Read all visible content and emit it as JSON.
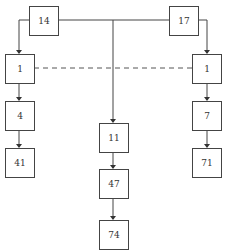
{
  "diagram": {
    "nodes": [
      {
        "id": "n14",
        "label": "14",
        "x": 29,
        "y": 6,
        "w": 29,
        "h": 29
      },
      {
        "id": "n17",
        "label": "17",
        "x": 169,
        "y": 6,
        "w": 29,
        "h": 29
      },
      {
        "id": "n1L",
        "label": "1",
        "x": 5,
        "y": 54,
        "w": 29,
        "h": 29
      },
      {
        "id": "n1R",
        "label": "1",
        "x": 192,
        "y": 54,
        "w": 29,
        "h": 29
      },
      {
        "id": "n4",
        "label": "4",
        "x": 5,
        "y": 101,
        "w": 29,
        "h": 29
      },
      {
        "id": "n41",
        "label": "41",
        "x": 5,
        "y": 148,
        "w": 29,
        "h": 29
      },
      {
        "id": "n7",
        "label": "7",
        "x": 192,
        "y": 101,
        "w": 29,
        "h": 29
      },
      {
        "id": "n71",
        "label": "71",
        "x": 192,
        "y": 148,
        "w": 29,
        "h": 29
      },
      {
        "id": "n11",
        "label": "11",
        "x": 99,
        "y": 123,
        "w": 29,
        "h": 29
      },
      {
        "id": "n47",
        "label": "47",
        "x": 99,
        "y": 169,
        "w": 29,
        "h": 29
      },
      {
        "id": "n74",
        "label": "74",
        "x": 99,
        "y": 220,
        "w": 29,
        "h": 29
      }
    ],
    "edges": [
      {
        "from": "n14",
        "to": "n1L",
        "style": "solid",
        "arrow": true
      },
      {
        "from": "n17",
        "to": "n1R",
        "style": "solid",
        "arrow": true
      },
      {
        "from": "n14",
        "to": "n17",
        "style": "solid",
        "arrow": false
      },
      {
        "from": "n14-n17-line",
        "to": "n11",
        "style": "solid",
        "arrow": true
      },
      {
        "from": "n1L",
        "to": "n4",
        "style": "solid",
        "arrow": true
      },
      {
        "from": "n4",
        "to": "n41",
        "style": "solid",
        "arrow": true
      },
      {
        "from": "n1R",
        "to": "n7",
        "style": "solid",
        "arrow": true
      },
      {
        "from": "n7",
        "to": "n71",
        "style": "solid",
        "arrow": true
      },
      {
        "from": "n11",
        "to": "n47",
        "style": "solid",
        "arrow": true
      },
      {
        "from": "n47",
        "to": "n74",
        "style": "solid",
        "arrow": true
      },
      {
        "from": "n1L",
        "to": "n1R",
        "style": "dashed",
        "arrow": false
      }
    ]
  }
}
